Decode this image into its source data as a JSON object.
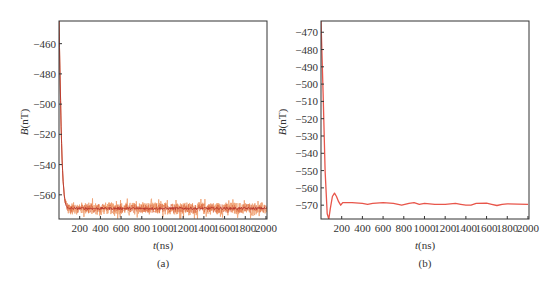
{
  "chart_data": [
    {
      "id": "a",
      "type": "line",
      "caption": "(a)",
      "xlabel": "t (ns)",
      "xlabel_italic": "t",
      "xlabel_unit": "(ns)",
      "ylabel": "B (nT)",
      "ylabel_italic": "B",
      "ylabel_unit": "(nT)",
      "xlim": [
        0,
        2010
      ],
      "ylim": [
        -576,
        -445
      ],
      "xticks": [
        200,
        400,
        600,
        800,
        1000,
        1200,
        1400,
        1600,
        1800,
        2000
      ],
      "yticks": [
        -460,
        -480,
        -500,
        -520,
        -540,
        -560
      ],
      "grid": false,
      "frame": {
        "x0": 59,
        "y0": 21,
        "x1": 267,
        "y1": 219
      },
      "series": [
        {
          "name": "noisy signal",
          "color": "#f0a070",
          "style": "noisy",
          "steady_value": -569,
          "noise_amplitude": 5,
          "x": [
            0,
            10,
            20,
            30,
            40,
            50,
            60,
            70,
            80,
            100
          ],
          "y": [
            -445,
            -480,
            -515,
            -537,
            -551,
            -560,
            -565,
            -567,
            -568.5,
            -569
          ]
        },
        {
          "name": "mean signal",
          "color": "#b5332a",
          "style": "solid",
          "x": [
            0,
            10,
            20,
            30,
            40,
            50,
            60,
            70,
            80,
            100,
            2000
          ],
          "y": [
            -445,
            -480,
            -515,
            -537,
            -551,
            -560,
            -565,
            -567,
            -568.5,
            -569,
            -569
          ]
        }
      ]
    },
    {
      "id": "b",
      "type": "line",
      "caption": "(b)",
      "xlabel": "t (ns)",
      "xlabel_italic": "t",
      "xlabel_unit": "(ns)",
      "ylabel": "B (nT)",
      "ylabel_italic": "B",
      "ylabel_unit": "(nT)",
      "xlim": [
        0,
        2010
      ],
      "ylim": [
        -578,
        -463.5
      ],
      "xticks": [
        200,
        400,
        600,
        800,
        1000,
        1200,
        1400,
        1600,
        1800,
        2000
      ],
      "yticks": [
        -470,
        -480,
        -490,
        -500,
        -510,
        -520,
        -530,
        -540,
        -550,
        -560,
        -570
      ],
      "grid": false,
      "frame": {
        "x0": 321,
        "y0": 21,
        "x1": 529,
        "y1": 219
      },
      "series": [
        {
          "name": "filtered signal",
          "color": "#e8554a",
          "style": "solid",
          "x": [
            0,
            20,
            40,
            60,
            75,
            90,
            110,
            130,
            150,
            170,
            190,
            210,
            250,
            300,
            400,
            450,
            500,
            600,
            700,
            780,
            850,
            900,
            950,
            1000,
            1100,
            1200,
            1300,
            1350,
            1400,
            1450,
            1500,
            1600,
            1650,
            1700,
            1750,
            1800,
            1900,
            2000
          ],
          "y": [
            -463.5,
            -505,
            -550,
            -575,
            -578,
            -572,
            -565,
            -563,
            -565,
            -568,
            -570,
            -568.5,
            -568.5,
            -568.5,
            -569,
            -569.5,
            -569,
            -568.5,
            -569,
            -570,
            -569,
            -568.5,
            -569.5,
            -569,
            -569.5,
            -569.5,
            -569,
            -569.5,
            -570,
            -570,
            -569,
            -568.8,
            -569.5,
            -570.2,
            -569.5,
            -569.2,
            -569.4,
            -569.5
          ]
        }
      ]
    }
  ]
}
